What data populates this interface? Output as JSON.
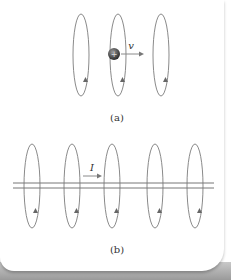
{
  "panel_a": {
    "label": "(a)",
    "velocity_label": "v",
    "charge_sign": "+",
    "loops_x": [
      81,
      118,
      161
    ]
  },
  "panel_b": {
    "label": "(b)",
    "current_label": "I",
    "loops_x": [
      32,
      72,
      112,
      155,
      195
    ]
  },
  "colors": {
    "stroke": "#8a8a8a",
    "charge": "#444444",
    "text": "#333333"
  }
}
